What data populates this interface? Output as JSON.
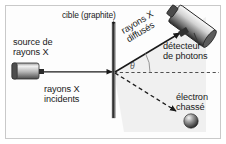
{
  "figure": {
    "background": "#fdfdfd",
    "border_color": "#c9c9c9"
  },
  "labels": {
    "target": "cible (graphite)",
    "source": "source de\nrayons X",
    "incident_beam": "rayons X\nincidents",
    "scattered_beam": "rayons X\ndiffusés",
    "detector": "détecteur\nde photons",
    "electron": "électron\nchassé",
    "angle": "θ"
  },
  "elements": {
    "xray_source": "xray-source-cylinder",
    "graphite_target": "graphite-rod",
    "photon_detector": "detector-cylinder",
    "ejected_electron": "electron-sphere",
    "incident_arrow": "solid-arrow-right",
    "scattered_arrow": "solid-arrow-upright",
    "electron_arrow": "dashed-arrow-downright",
    "reference_axis": "dashed-horizontal-line",
    "angle_arc": "theta-arc"
  },
  "geometry": {
    "scatter_point_x": 114,
    "scatter_point_y": 72,
    "scattering_angle_deg": 31,
    "electron_angle_deg": 38
  },
  "colors": {
    "ink": "#1a1a1a",
    "metal_light": "#e8e8e8",
    "metal_dark": "#3a3a3a",
    "wedge_fill": "#eeeeee",
    "graphite_dark": "#101010"
  }
}
